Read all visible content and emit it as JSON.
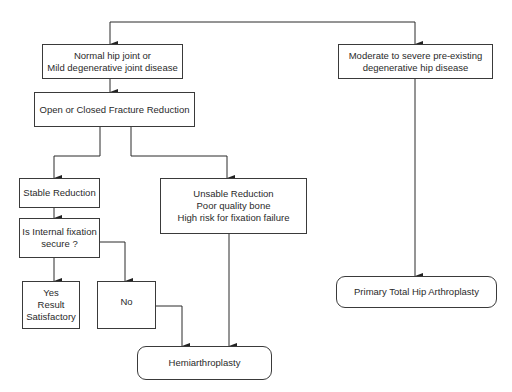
{
  "diagram": {
    "type": "flowchart",
    "nodes": {
      "normal_hip": "Normal hip joint or\nMild degenerative joint disease",
      "fracture_reduction": "Open or Closed Fracture Reduction",
      "stable_reduction": "Stable Reduction",
      "fixation_secure": "Is Internal fixation\nsecure ?",
      "yes_result": "Yes\nResult\nSatisfactory",
      "no": "No",
      "unstable_reduction": "Unsable Reduction\nPoor quality bone\nHigh risk for fixation failure",
      "hemiarthroplasty": "Hemiarthroplasty",
      "moderate_severe": "Moderate to severe pre-existing\ndegenerative hip disease",
      "total_hip": "Primary Total Hip Arthroplasty"
    },
    "edges": [
      [
        "start",
        "normal_hip"
      ],
      [
        "start",
        "moderate_severe"
      ],
      [
        "normal_hip",
        "fracture_reduction"
      ],
      [
        "fracture_reduction",
        "stable_reduction"
      ],
      [
        "fracture_reduction",
        "unstable_reduction"
      ],
      [
        "stable_reduction",
        "fixation_secure"
      ],
      [
        "fixation_secure",
        "yes_result"
      ],
      [
        "fixation_secure",
        "no"
      ],
      [
        "no",
        "hemiarthroplasty"
      ],
      [
        "unstable_reduction",
        "hemiarthroplasty"
      ],
      [
        "moderate_severe",
        "total_hip"
      ]
    ],
    "colors": {
      "line": "#2a2a2a",
      "background": "#ffffff"
    }
  }
}
